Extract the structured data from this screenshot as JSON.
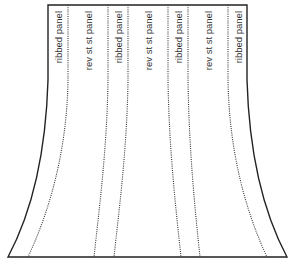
{
  "diagram": {
    "type": "skirt-panel-schematic",
    "outline": {
      "top_left": [
        48,
        5
      ],
      "top_right": [
        247,
        5
      ],
      "bottom_left": [
        8,
        257
      ],
      "bottom_right": [
        287,
        257
      ],
      "stroke": "#222222"
    },
    "seam_lines": [
      {
        "top_x": 68,
        "bottom_x": 28
      },
      {
        "top_x": 108,
        "bottom_x": 94
      },
      {
        "top_x": 128,
        "bottom_x": 114
      },
      {
        "top_x": 168,
        "bottom_x": 181
      },
      {
        "top_x": 188,
        "bottom_x": 200
      },
      {
        "top_x": 228,
        "bottom_x": 267
      }
    ],
    "panels": [
      {
        "label": "ribbed panel",
        "x": 58
      },
      {
        "label": "rev st st panel",
        "x": 88
      },
      {
        "label": "ribbed panel",
        "x": 118
      },
      {
        "label": "rev st st panel",
        "x": 148
      },
      {
        "label": "ribbed panel",
        "x": 178
      },
      {
        "label": "rev st st panel",
        "x": 208
      },
      {
        "label": "ribbed panel",
        "x": 238
      }
    ]
  }
}
